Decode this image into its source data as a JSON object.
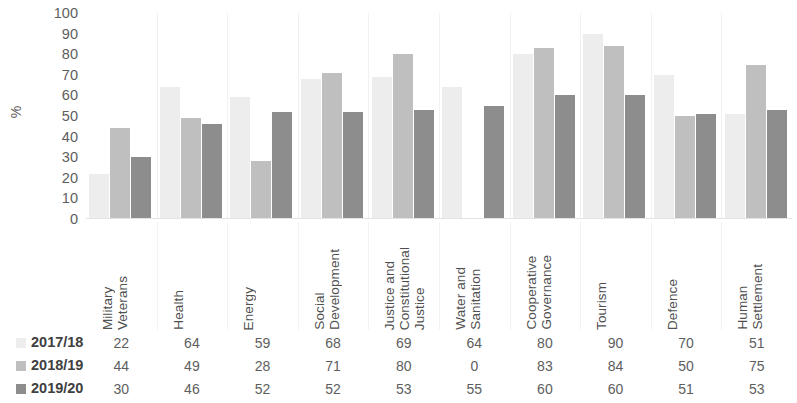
{
  "chart_data": {
    "type": "bar",
    "title": "",
    "xlabel": "",
    "ylabel": "%",
    "ylim": [
      0,
      100
    ],
    "ytick_step": 10,
    "yticks": [
      100,
      90,
      80,
      70,
      60,
      50,
      40,
      30,
      20,
      10,
      0
    ],
    "grid": false,
    "legend_position": "bottom-table",
    "categories": [
      "Military Veterans",
      "Health",
      "Energy",
      "Social Development",
      "Justice and Constitutional Justice",
      "Water and Sanitation",
      "Cooperative Governance",
      "Tourism",
      "Defence",
      "Human Settlement"
    ],
    "category_lines": [
      [
        "Military",
        "Veterans"
      ],
      [
        "Health"
      ],
      [
        "Energy"
      ],
      [
        "Social",
        "Development"
      ],
      [
        "Justice and",
        "Constitutional",
        "Justice"
      ],
      [
        "Water and",
        "Sanitation"
      ],
      [
        "Cooperative",
        "Governance"
      ],
      [
        "Tourism"
      ],
      [
        "Defence"
      ],
      [
        "Human",
        "Settlement"
      ]
    ],
    "series": [
      {
        "name": "2017/18",
        "color": "#ededed",
        "values": [
          22,
          64,
          59,
          68,
          69,
          64,
          80,
          90,
          70,
          51
        ]
      },
      {
        "name": "2018/19",
        "color": "#bfbfbf",
        "values": [
          44,
          49,
          28,
          71,
          80,
          0,
          83,
          84,
          50,
          75
        ]
      },
      {
        "name": "2019/20",
        "color": "#8d8d8d",
        "values": [
          30,
          46,
          52,
          52,
          53,
          55,
          60,
          60,
          51,
          53
        ]
      }
    ]
  },
  "axis": {
    "y_label": "%"
  }
}
